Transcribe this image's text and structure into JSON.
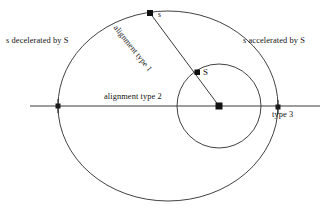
{
  "figure": {
    "background": "#ffffff",
    "stroke_color": "#2b2b2b",
    "labels": {
      "decelerated": "s decelerated by S",
      "accelerated": "s accelerated by S",
      "alignment_type_1": "alignment type 1",
      "alignment_type_2": "alignment type 2",
      "type_3": "type 3",
      "point_s_small": "s",
      "point_S_big": "S"
    },
    "geometry": {
      "outer_ellipse": {
        "cx": 168,
        "cy": 106,
        "rx": 110,
        "ry": 95
      },
      "inner_circle": {
        "cx": 219,
        "cy": 106,
        "r": 42
      },
      "horizontal_line": {
        "x1": 30,
        "y1": 106,
        "x2": 320,
        "y2": 106
      },
      "diagonal_line": {
        "x1": 150,
        "y1": 13,
        "x2": 219,
        "y2": 106
      },
      "markers": [
        {
          "name": "s-on-outer-ellipse",
          "x": 150,
          "y": 13,
          "shape": "square"
        },
        {
          "name": "S-on-inner-circle",
          "x": 197,
          "y": 72,
          "shape": "square"
        },
        {
          "name": "center-body",
          "x": 219,
          "y": 106,
          "shape": "square"
        },
        {
          "name": "left-crossing",
          "x": 58,
          "y": 106,
          "shape": "cross"
        },
        {
          "name": "right-crossing",
          "x": 278,
          "y": 107,
          "shape": "cross"
        }
      ]
    }
  }
}
